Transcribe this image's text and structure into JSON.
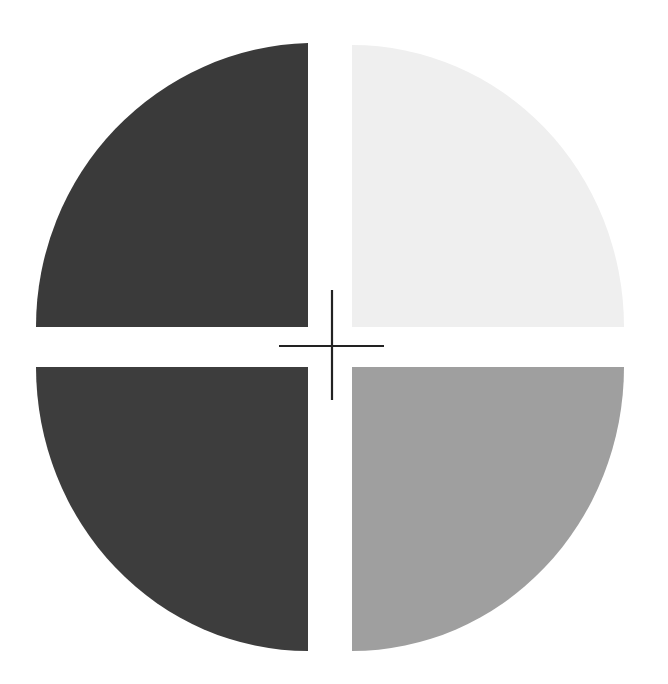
{
  "figure": {
    "quadrants": [
      {
        "id": "top-left",
        "label": "Quadrant top-left",
        "color": "#3a3a3a"
      },
      {
        "id": "top-right",
        "label": "Quadrant top-right",
        "color": "#efefef"
      },
      {
        "id": "bottom-left",
        "label": "Quadrant bottom-left",
        "color": "#3d3d3d"
      },
      {
        "id": "bottom-right",
        "label": "Quadrant bottom-right",
        "color": "#9f9f9f"
      }
    ],
    "crosshair": {
      "color": "#222222"
    }
  }
}
